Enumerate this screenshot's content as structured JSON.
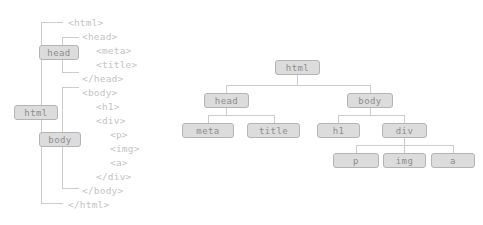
{
  "diagram": {
    "colors": {
      "node_fill": "#dcdcdc",
      "node_border": "#b4b4b4",
      "node_text": "#8c8c8c",
      "code_text": "#c4c4c4",
      "connector": "#cccccc",
      "background": "#ffffff"
    }
  },
  "markup": {
    "lines": [
      {
        "text": "<html>",
        "indent": 0
      },
      {
        "text": "<head>",
        "indent": 1
      },
      {
        "text": "<meta>",
        "indent": 2
      },
      {
        "text": "<title>",
        "indent": 2
      },
      {
        "text": "</head>",
        "indent": 1
      },
      {
        "text": "<body>",
        "indent": 1
      },
      {
        "text": "<h1>",
        "indent": 2
      },
      {
        "text": "<div>",
        "indent": 2
      },
      {
        "text": "<p>",
        "indent": 3
      },
      {
        "text": "<img>",
        "indent": 3
      },
      {
        "text": "<a>",
        "indent": 3
      },
      {
        "text": "</div>",
        "indent": 2
      },
      {
        "text": "</body>",
        "indent": 1
      },
      {
        "text": "</html>",
        "indent": 0
      }
    ],
    "scope_labels": [
      {
        "label": "html",
        "name": "scope-label-html"
      },
      {
        "label": "head",
        "name": "scope-label-head"
      },
      {
        "label": "body",
        "name": "scope-label-body"
      }
    ]
  },
  "tree": {
    "root": {
      "label": "html"
    },
    "nodes": [
      {
        "id": "html",
        "label": "html",
        "level": 0
      },
      {
        "id": "head",
        "label": "head",
        "level": 1
      },
      {
        "id": "body",
        "label": "body",
        "level": 1
      },
      {
        "id": "meta",
        "label": "meta",
        "level": 2
      },
      {
        "id": "title",
        "label": "title",
        "level": 2
      },
      {
        "id": "h1",
        "label": "h1",
        "level": 2
      },
      {
        "id": "div",
        "label": "div",
        "level": 2
      },
      {
        "id": "p",
        "label": "p",
        "level": 3
      },
      {
        "id": "img",
        "label": "img",
        "level": 3
      },
      {
        "id": "a",
        "label": "a",
        "level": 3
      }
    ],
    "edges": [
      {
        "from": "html",
        "to": "head"
      },
      {
        "from": "html",
        "to": "body"
      },
      {
        "from": "head",
        "to": "meta"
      },
      {
        "from": "head",
        "to": "title"
      },
      {
        "from": "body",
        "to": "h1"
      },
      {
        "from": "body",
        "to": "div"
      },
      {
        "from": "div",
        "to": "p"
      },
      {
        "from": "div",
        "to": "img"
      },
      {
        "from": "div",
        "to": "a"
      }
    ]
  }
}
